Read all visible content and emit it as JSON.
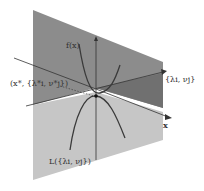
{
  "diagram": {
    "type": "saddle-point-illustration",
    "labels": {
      "f_x": "f(x)",
      "saddle_point": "(x*, {λ*i, ν*j})",
      "dual_axis": "{λi, νj}",
      "x_axis": "x",
      "lagrangian_dual": "L({λi, νj})"
    },
    "colors": {
      "upper_plane": "#8a8a8a",
      "upper_plane_right": "#6f6f6f",
      "lower_plane": "#c4c4c4",
      "curve": "#3a3a3a",
      "axis": "#333333",
      "point": "#111111"
    }
  }
}
